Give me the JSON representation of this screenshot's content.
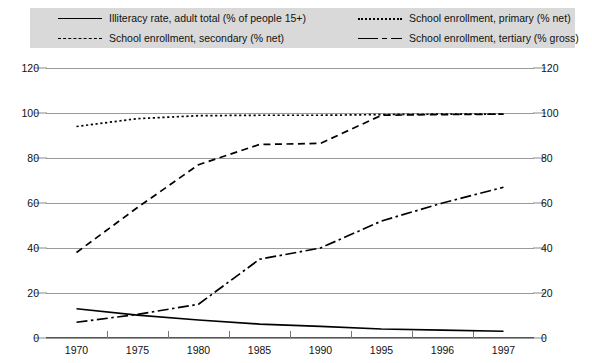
{
  "legend": {
    "entries": [
      {
        "label": "Illiteracy rate, adult total (% of people 15+)",
        "style": "solid",
        "name": "legend-illiteracy"
      },
      {
        "label": "School enrollment, primary (% net)",
        "style": "dotted",
        "name": "legend-primary"
      },
      {
        "label": "School enrollment, secondary (% net)",
        "style": "dashed",
        "name": "legend-secondary"
      },
      {
        "label": "School enrollment, tertiary (% gross)",
        "style": "dashdot",
        "name": "legend-tertiary"
      }
    ]
  },
  "chart_data": {
    "type": "line",
    "title": "",
    "xlabel": "",
    "ylabel": "",
    "ylim": [
      0,
      120
    ],
    "yticks": [
      0,
      20,
      40,
      60,
      80,
      100,
      120
    ],
    "grid": true,
    "dual_y_axis": true,
    "legend_position": "top",
    "categories": [
      "1970",
      "1975",
      "1980",
      "1985",
      "1990",
      "1995",
      "1996",
      "1997"
    ],
    "series": [
      {
        "name": "Illiteracy rate, adult total (% of people 15+)",
        "style": "solid",
        "color": "#000000",
        "values": [
          13.0,
          10.2,
          8.0,
          6.2,
          5.2,
          4.0,
          3.5,
          3.0
        ]
      },
      {
        "name": "School enrollment, primary (% net)",
        "style": "dotted",
        "color": "#000000",
        "values": [
          94.0,
          97.5,
          98.8,
          99.0,
          99.0,
          99.3,
          99.5,
          99.5
        ]
      },
      {
        "name": "School enrollment, secondary (% net)",
        "style": "dashed",
        "color": "#000000",
        "values": [
          38.0,
          58.0,
          77.0,
          86.0,
          86.5,
          99.0,
          99.3,
          99.5
        ]
      },
      {
        "name": "School enrollment, tertiary (% gross)",
        "style": "dashdot",
        "color": "#000000",
        "values": [
          7.0,
          10.5,
          15.0,
          35.0,
          40.0,
          52.0,
          60.0,
          67.0
        ]
      }
    ]
  },
  "axes": {
    "left_ticks": [
      "120",
      "100",
      "80",
      "60",
      "40",
      "20",
      "0"
    ],
    "right_ticks": [
      "120",
      "100",
      "80",
      "60",
      "40",
      "20",
      "0"
    ]
  },
  "colors": {
    "legend_background": "#d9d9d9",
    "gridline": "#9a9a9a",
    "series": "#000000",
    "page_background": "#ffffff"
  }
}
